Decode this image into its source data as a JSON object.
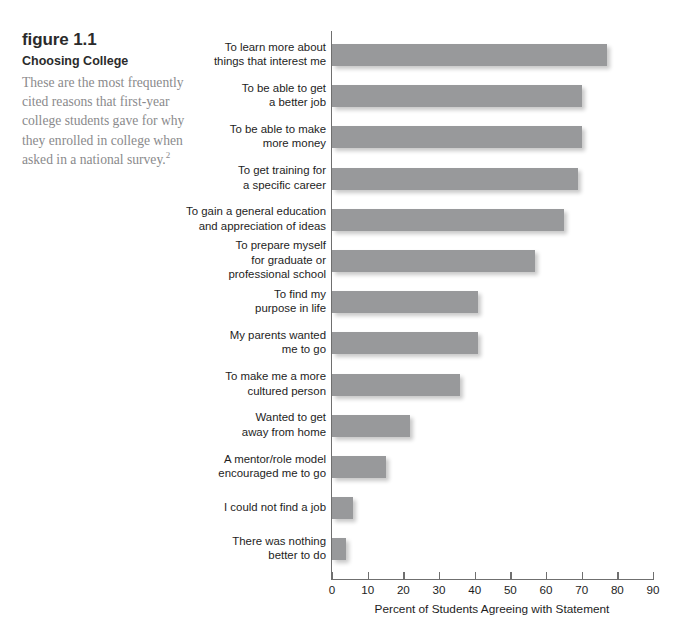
{
  "caption": {
    "figure_number": "figure 1.1",
    "title": "Choosing College",
    "body": "These are the most frequently cited reasons that first-year college students gave for why they enrolled in college when asked in a national survey.",
    "footnote_marker": "2"
  },
  "chart_data": {
    "type": "bar",
    "orientation": "horizontal",
    "title": "Choosing College",
    "xlabel": "Percent of Students Agreeing with Statement",
    "ylabel": "",
    "xlim": [
      0,
      90
    ],
    "xticks": [
      0,
      10,
      20,
      30,
      40,
      50,
      60,
      70,
      80,
      90
    ],
    "xtick_labels": [
      "0",
      "10",
      "20",
      "30",
      "40",
      "50",
      "60",
      "70",
      "80",
      "90"
    ],
    "grid": false,
    "legend": null,
    "bar_color": "#98999b",
    "categories": [
      "To learn more about\nthings that interest me",
      "To be able to get\na better job",
      "To be able to make\nmore money",
      "To get training for\na specific career",
      "To gain a general education\nand appreciation of ideas",
      "To prepare myself\nfor graduate or\nprofessional school",
      "To find my\npurpose in life",
      "My parents wanted\nme to go",
      "To make me a more\ncultured person",
      "Wanted to get\naway from home",
      "A mentor/role model\nencouraged me to go",
      "I could not find a job",
      "There was nothing\nbetter to do"
    ],
    "values": [
      77,
      70,
      70,
      69,
      65,
      57,
      41,
      41,
      36,
      22,
      15,
      6,
      4
    ]
  }
}
